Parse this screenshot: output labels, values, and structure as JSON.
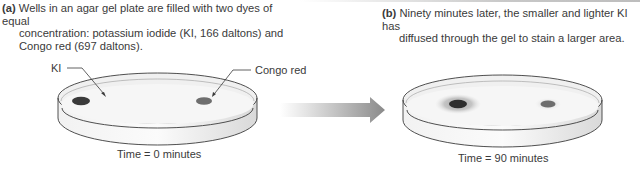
{
  "panel_a": {
    "tag": "(a)",
    "caption_line1": "Wells in an agar gel plate are filled with two dyes of equal",
    "caption_line2": "concentration: potassium iodide (KI, 166 daltons) and",
    "caption_line3": "Congo red (697 daltons).",
    "label_ki": "KI",
    "label_congo": "Congo red",
    "time_label": "Time = 0 minutes"
  },
  "panel_b": {
    "tag": "(b)",
    "caption_line1": "Ninety minutes later, the smaller and lighter KI has",
    "caption_line2": "diffused through the gel to stain a larger area.",
    "time_label": "Time = 90 minutes"
  },
  "colors": {
    "ki_dye": "#3a3a3a",
    "congo_dye": "#6e6e6e",
    "ki_halo": "#b5b5b5",
    "dish_outline": "#3c3c3c",
    "arrow": "#8a8a8a"
  },
  "icons": {
    "arrow": "right-arrow-icon"
  }
}
